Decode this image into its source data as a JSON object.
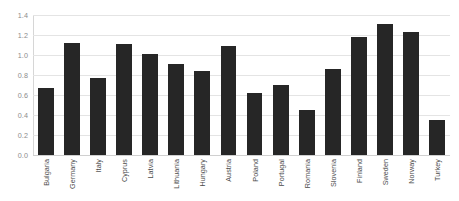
{
  "chart_data": {
    "type": "bar",
    "title": "",
    "subtitle": "",
    "xlabel": "",
    "ylabel": "",
    "ylim": [
      0.0,
      1.4
    ],
    "ytick_labels": [
      "0.0",
      "0.2",
      "0.4",
      "0.6",
      "0.8",
      "1.0",
      "1.2",
      "1.4"
    ],
    "ytick_values": [
      0.0,
      0.2,
      0.4,
      0.6,
      0.8,
      1.0,
      1.2,
      1.4
    ],
    "grid": true,
    "legend": false,
    "legend_position": "none",
    "bar_color": "#262626",
    "gridline_color": "#e4e4e4",
    "axis_label_color": "#8c8c8c",
    "category_label_color": "#4a4a4a",
    "background_color": "#ffffff",
    "categories": [
      "Bulgaria",
      "Germany",
      "Italy",
      "Cyprus",
      "Latvia",
      "Lithuania",
      "Hungary",
      "Austria",
      "Poland",
      "Portugal",
      "Romania",
      "Slovenia",
      "Finland",
      "Sweden",
      "Norway",
      "Turkey"
    ],
    "values": [
      0.67,
      1.12,
      0.77,
      1.11,
      1.01,
      0.91,
      0.84,
      1.09,
      0.62,
      0.7,
      0.45,
      0.86,
      1.18,
      1.31,
      1.23,
      0.35
    ]
  }
}
